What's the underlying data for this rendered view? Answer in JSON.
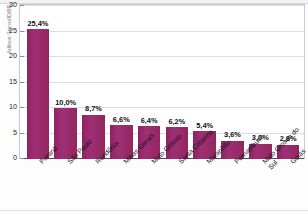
{
  "credit": "Adilson Secco/ID/BR",
  "title_strip": "",
  "chart_data": {
    "type": "bar",
    "title": "",
    "subtitle": "",
    "xlabel": "",
    "ylabel": "Em porcentagem",
    "ylim": [
      0,
      30
    ],
    "yticks": [
      0,
      5,
      10,
      15,
      20,
      25,
      30
    ],
    "ytick_labels": [
      "0",
      "5",
      "10",
      "15",
      "20",
      "25",
      "30"
    ],
    "grid": true,
    "legend": "none",
    "bar_color": "#99286c",
    "categories": [
      "Paraná",
      "São Paulo",
      "Rondônia",
      "Minas Gerais",
      "Mato Grosso",
      "Santa Catarina",
      "Maranhão",
      "Pernambuco",
      "Mato Grosso do Sul",
      "Goiás"
    ],
    "values": [
      25.4,
      10.0,
      8.7,
      6.6,
      6.4,
      6.2,
      5.4,
      3.6,
      3.0,
      2.8
    ],
    "value_labels": [
      "25,4%",
      "10,0%",
      "8,7%",
      "6,6%",
      "6,4%",
      "6,2%",
      "5,4%",
      "3,6%",
      "3,0%",
      "2,8%"
    ]
  }
}
